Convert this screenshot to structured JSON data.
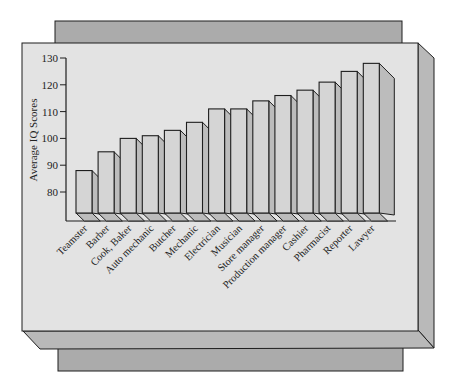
{
  "chart_data": {
    "type": "bar",
    "style": "3d",
    "title": "",
    "xlabel": "",
    "ylabel": "Average IQ Scores",
    "ylim": [
      80,
      130
    ],
    "yticks": [
      80,
      90,
      100,
      110,
      120,
      130
    ],
    "grid": false,
    "legend": "none",
    "categories": [
      "Teamster",
      "Barber",
      "Cook, Baker",
      "Auto mechanic",
      "Butcher",
      "Mechanic",
      "Electrician",
      "Musician",
      "Store manager",
      "Production manager",
      "Cashier",
      "Pharmacist",
      "Reporter",
      "Lawyer"
    ],
    "values": [
      88,
      95,
      100,
      101,
      103,
      106,
      111,
      111,
      114,
      116,
      118,
      121,
      125,
      128
    ]
  },
  "colors": {
    "panel_front": "#e3e3e3",
    "panel_side": "#b9b9b9",
    "panel_back": "#ababab",
    "bar_front": "#d5d5d5",
    "bar_side": "#bcbcbc",
    "bar_top": "#c8c8c8",
    "outline": "#1e1e1e"
  }
}
